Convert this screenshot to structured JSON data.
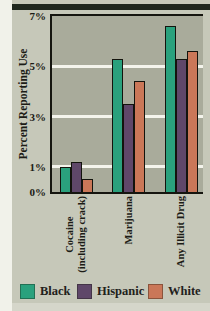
{
  "figure": {
    "y_axis_title": "Percent Reporting Use"
  },
  "chart_data": {
    "type": "bar",
    "title": "",
    "xlabel": "",
    "ylabel": "Percent Reporting Use",
    "ylim": [
      0,
      7
    ],
    "yticks": [
      {
        "value": 7,
        "label": "7%"
      },
      {
        "value": 5,
        "label": "5%"
      },
      {
        "value": 3,
        "label": "3%"
      },
      {
        "value": 1,
        "label": "1%"
      },
      {
        "value": 0,
        "label": "0%"
      }
    ],
    "gridline_values": [
      5,
      3,
      1
    ],
    "grid": "horizontal-white-lines",
    "legend_position": "bottom",
    "categories": [
      "Cocaine (including crack)",
      "Marijuana",
      "Any Illicit Drug"
    ],
    "category_label_lines": [
      [
        "Cocaine",
        "(including crack)"
      ],
      [
        "Marijuana"
      ],
      [
        "Any Illicit Drug"
      ]
    ],
    "series": [
      {
        "name": "Black",
        "color": "#2aa17d",
        "values": [
          1.0,
          5.3,
          6.6
        ]
      },
      {
        "name": "Hispanic",
        "color": "#5f4769",
        "values": [
          1.2,
          3.5,
          5.3
        ]
      },
      {
        "name": "White",
        "color": "#ca7758",
        "values": [
          0.5,
          4.4,
          5.6
        ]
      }
    ],
    "colors": {
      "plot_background": "#a9ab9b",
      "figure_background": "#c6c8b9",
      "gridline": "#f4f4ec",
      "top_rule": "#1f271e",
      "text": "#1c1c16"
    }
  }
}
